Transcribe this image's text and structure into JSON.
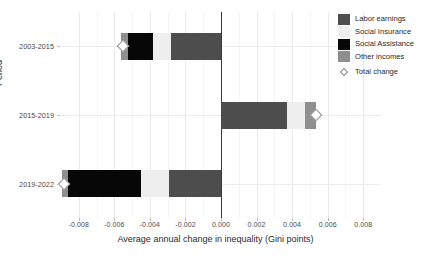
{
  "chart_data": {
    "type": "bar",
    "orientation": "horizontal",
    "stacked": true,
    "title": "",
    "xlabel": "Average annual change in inequality (Gini points)",
    "ylabel": "Period",
    "categories": [
      "2003-2015",
      "2015-2019",
      "2019-2022"
    ],
    "xlim": [
      -0.009,
      0.009
    ],
    "xticks": [
      -0.008,
      -0.006,
      -0.004,
      -0.002,
      0.0,
      0.002,
      0.004,
      0.006,
      0.008
    ],
    "xticklabels": [
      "-0.008",
      "-0.006",
      "-0.004",
      "-0.002",
      "0.000",
      "0.002",
      "0.004",
      "0.006",
      "0.008"
    ],
    "grid": "vertical-and-horizontal",
    "legend_position": "right",
    "zero_reference_line": 0.0,
    "series": [
      {
        "name": "Labor earnings",
        "color": "#4d4d4d",
        "values": [
          -0.0028,
          0.0037,
          -0.0029
        ]
      },
      {
        "name": "Social Insurance",
        "color": "#eeeeee",
        "values": [
          -0.001,
          0.001,
          -0.0016
        ]
      },
      {
        "name": "Social Assistance",
        "color": "#070707",
        "values": [
          -0.00145,
          0.0,
          -0.0041
        ]
      },
      {
        "name": "Other incomes",
        "color": "#8f8f8f",
        "values": [
          -0.00038,
          0.00065,
          -0.00035
        ]
      }
    ],
    "marker_series": {
      "name": "Total change",
      "marker": "diamond-open",
      "color": "#8a8a8a",
      "values": [
        -0.00552,
        0.00533,
        -0.00885
      ]
    }
  },
  "legend": {
    "items": [
      {
        "label": "Labor earnings",
        "swatch": "labor"
      },
      {
        "label": "Social Insurance",
        "swatch": "insurance"
      },
      {
        "label": "Social Assistance",
        "swatch": "assistance"
      },
      {
        "label": "Other incomes",
        "swatch": "other"
      }
    ],
    "total": {
      "label": "Total change",
      "swatch": "marker-sw"
    }
  },
  "axes": {
    "x": {
      "label": "Average annual change in inequality (Gini points)",
      "ticks": [
        "-0.008",
        "-0.006",
        "-0.004",
        "-0.002",
        "0.000",
        "0.002",
        "0.004",
        "0.006",
        "0.008"
      ]
    },
    "y": {
      "label": "Period",
      "ticks": [
        "2003-2015",
        "2015-2019",
        "2019-2022"
      ]
    }
  }
}
